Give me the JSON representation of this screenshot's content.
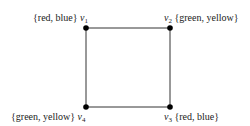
{
  "diagram": {
    "type": "graph-coloring",
    "vertices": [
      {
        "id": "v1",
        "name": "v",
        "sub": "1",
        "list": "{red, blue}",
        "x": 86,
        "y": 28
      },
      {
        "id": "v2",
        "name": "v",
        "sub": "2",
        "list": "{green, yellow}",
        "x": 170,
        "y": 28
      },
      {
        "id": "v3",
        "name": "v",
        "sub": "3",
        "list": "{red, blue}",
        "x": 170,
        "y": 107
      },
      {
        "id": "v4",
        "name": "v",
        "sub": "4",
        "list": "{green, yellow}",
        "x": 86,
        "y": 107
      }
    ],
    "edges": [
      [
        "v1",
        "v2"
      ],
      [
        "v2",
        "v3"
      ],
      [
        "v3",
        "v4"
      ],
      [
        "v4",
        "v1"
      ]
    ],
    "colors": {
      "line": "#333333",
      "vertex": "#000000"
    }
  }
}
